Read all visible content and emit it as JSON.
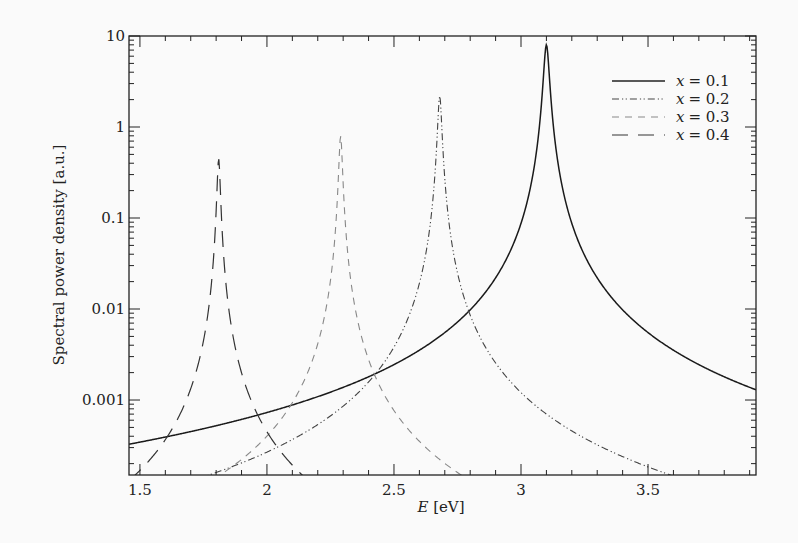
{
  "chart_data": {
    "type": "line",
    "title": "",
    "xlabel": "E [eV]",
    "xlabel_var": "E",
    "xlabel_unit": "[eV]",
    "ylabel": "Spectral power density [a.u.]",
    "xlim": [
      1.457,
      3.925
    ],
    "ylim": [
      0.00015,
      10
    ],
    "yscale": "log",
    "grid": false,
    "legend_position": "upper right",
    "x_ticks": [
      1.5,
      2,
      2.5,
      3,
      3.5
    ],
    "x_tick_labels": [
      "1.5",
      "2",
      "2.5",
      "3",
      "3.5"
    ],
    "y_ticks": [
      0.001,
      0.01,
      0.1,
      1,
      10
    ],
    "y_tick_labels": [
      "0.001",
      "0.01",
      "0.1",
      "1",
      "10"
    ],
    "series": [
      {
        "name": "x = 0.1",
        "style": "solid",
        "peak_E": 3.1,
        "peak_value": 8.0,
        "halfwidth": 0.0105
      },
      {
        "name": "x = 0.2",
        "style": "dash-dot-dot",
        "peak_E": 2.68,
        "peak_value": 2.2,
        "halfwidth": 0.0075
      },
      {
        "name": "x = 0.3",
        "style": "dashed-light",
        "peak_E": 2.29,
        "peak_value": 0.8,
        "halfwidth": 0.0065
      },
      {
        "name": "x = 0.4",
        "style": "long-dash",
        "peak_E": 1.81,
        "peak_value": 0.45,
        "halfwidth": 0.006
      }
    ]
  },
  "legend": {
    "items": [
      {
        "label": "x = 0.1",
        "var": "x",
        "eq": "= 0.1"
      },
      {
        "label": "x = 0.2",
        "var": "x",
        "eq": "= 0.2"
      },
      {
        "label": "x = 0.3",
        "var": "x",
        "eq": "= 0.3"
      },
      {
        "label": "x = 0.4",
        "var": "x",
        "eq": "= 0.4"
      }
    ]
  },
  "axes": {
    "xlabel_var": "E",
    "xlabel_unit": " [eV]",
    "ylabel": "Spectral power density [a.u.]"
  }
}
